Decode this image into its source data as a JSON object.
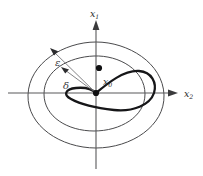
{
  "figure": {
    "background_color": "#ffffff"
  },
  "axes": {
    "vertical": {
      "label": "x",
      "subscript": "1",
      "name": "x1-axis",
      "direction": "up",
      "origin_x": 96,
      "top_y": 22
    },
    "horizontal": {
      "label": "x",
      "subscript": "2",
      "name": "x2-axis",
      "direction": "right",
      "origin_y": 93,
      "right_x": 178
    }
  },
  "annotations": {
    "epsilon": {
      "symbol": "ε",
      "meaning": "epsilon-neighborhood radius",
      "label_x": 58,
      "label_y": 63
    },
    "delta": {
      "symbol": "δ",
      "meaning": "delta-neighborhood radius",
      "label_x": 66,
      "label_y": 86
    },
    "initial_point": {
      "label": "x",
      "subscript": "0",
      "meaning": "initial condition",
      "label_x": 106,
      "label_y": 83,
      "dot_x": 99,
      "dot_y": 68
    },
    "origin_point": {
      "meaning": "equilibrium point at origin",
      "dot_x": 96,
      "dot_y": 93
    }
  },
  "curves": {
    "outer_ellipse": {
      "name": "epsilon-boundary",
      "cx": 96,
      "cy": 95,
      "rx": 68,
      "ry": 53,
      "stroke": "#4a4a4c"
    },
    "inner_ellipse": {
      "name": "delta-boundary",
      "cx": 94,
      "cy": 93,
      "rx": 50,
      "ry": 38,
      "stroke": "#4a4a4c"
    },
    "trajectory": {
      "name": "solution-trajectory",
      "stroke": "#161618",
      "description": "thick looping orbit starting near x0 and spiraling to the origin"
    }
  },
  "colors": {
    "axis": "#58585a",
    "level_curve": "#4a4a4c",
    "trajectory": "#161618",
    "radius_line": "#6d6d70",
    "text": "#2a2a2c"
  }
}
